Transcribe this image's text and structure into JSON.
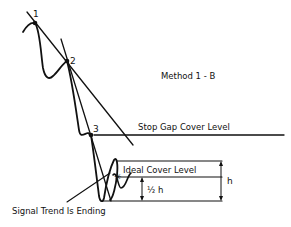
{
  "diagram": {
    "title": "Method 1 - B",
    "points": [
      {
        "label": "1",
        "x": 35,
        "y": 23
      },
      {
        "label": "2",
        "x": 67,
        "y": 61
      },
      {
        "label": "3",
        "x": 91,
        "y": 135
      }
    ],
    "levels": {
      "stop_gap": "Stop Gap Cover Level",
      "ideal": "Ideal Cover Level"
    },
    "measurements": {
      "h": "h",
      "half_h": "½ h"
    },
    "annotation": "Signal Trend Is Ending",
    "colors": {
      "ink": "#111111",
      "background": "#ffffff"
    }
  }
}
